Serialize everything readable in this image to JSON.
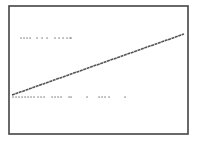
{
  "chart_data": {
    "type": "scatter",
    "title": "",
    "xlabel": "",
    "ylabel": "",
    "grid": false,
    "legend": null,
    "frame": {
      "x": 9,
      "y": 6,
      "width": 179,
      "height": 128,
      "color": "#444444"
    },
    "series": [
      {
        "name": "trend-line",
        "kind": "line",
        "color": "#555555",
        "points": [
          [
            12,
            95
          ],
          [
            184,
            34
          ]
        ]
      },
      {
        "name": "upper-dots",
        "kind": "scatter",
        "color": "#777777",
        "y": 38,
        "x": [
          21,
          24,
          27,
          30,
          37,
          42,
          47,
          55,
          59,
          63,
          67,
          70,
          71
        ]
      },
      {
        "name": "lower-dots",
        "kind": "scatter",
        "color": "#777777",
        "y": 97,
        "x": [
          13,
          16,
          19,
          22,
          25,
          28,
          31,
          34,
          38,
          41,
          44,
          52,
          55,
          58,
          61,
          69,
          71,
          87,
          99,
          102,
          105,
          109,
          125
        ]
      }
    ]
  }
}
